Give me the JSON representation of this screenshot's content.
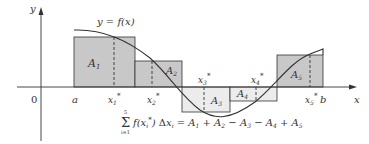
{
  "diagram": {
    "curve_label": "y = f(x)",
    "axes": {
      "x_label": "x",
      "y_label": "y",
      "origin_label": "0"
    },
    "interval": {
      "left": "a",
      "right": "b"
    },
    "sample_points": [
      "x1*",
      "x2*",
      "x3*",
      "x4*",
      "x5*"
    ],
    "rectangles": [
      {
        "label": "A1",
        "sign": "positive",
        "fill": "#c8c8c8"
      },
      {
        "label": "A2",
        "sign": "positive",
        "fill": "#c8c8c8"
      },
      {
        "label": "A3",
        "sign": "negative",
        "fill": "#ececec"
      },
      {
        "label": "A4",
        "sign": "negative",
        "fill": "#ececec"
      },
      {
        "label": "A5",
        "sign": "positive",
        "fill": "#c8c8c8"
      }
    ],
    "formula": {
      "sum_upper": "5",
      "sum_lower": "i=1",
      "lhs": "f(xi*) Δxi",
      "rhs": "A1 + A2 − A3 − A4 + A5"
    }
  },
  "colors": {
    "positive_fill": "#c8c8c8",
    "negative_fill": "#ececec",
    "stroke": "#333333"
  }
}
